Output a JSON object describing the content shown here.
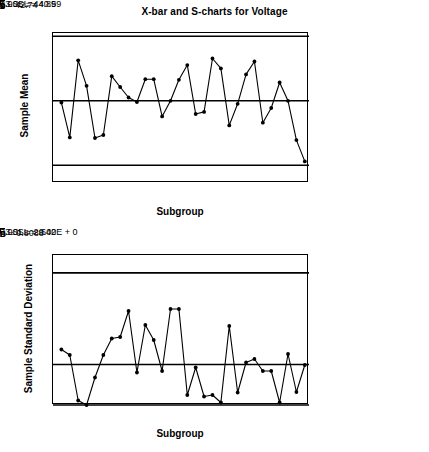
{
  "title": "X-bar and S-charts for Voltage",
  "charts": {
    "xbar": {
      "ylabel": "Sample Mean",
      "xlabel": "Subgroup",
      "yticks": [
        "40",
        "41",
        "42",
        "43",
        "44",
        "45"
      ],
      "xticks": [
        "0",
        "10",
        "20",
        "30"
      ],
      "ucl_label": "3.0SL = 44.89",
      "cl_bars": "=",
      "cl_symbol": "x",
      "cl_label": "= 42.74",
      "lcl_label": "−3.0SL = 40.59",
      "violation_marker": "1"
    },
    "s": {
      "ylabel": "Sample Standard Deviation",
      "xlabel": "Subgroup",
      "yticks": [
        "0",
        "1",
        "2",
        "3"
      ],
      "xticks": [
        "0",
        "10",
        "20",
        "30"
      ],
      "ucl_label": "3.0SL = 2.642",
      "cl_bars": "=",
      "cl_symbol": "S",
      "cl_label": "= 0.8088",
      "lcl_label": "−3.0SL = 0.00E + 0"
    }
  },
  "chart_data": [
    {
      "type": "line",
      "name": "xbar-chart",
      "title": "X-bar and S-charts for Voltage",
      "xlabel": "Subgroup",
      "ylabel": "Sample Mean",
      "xlim": [
        0,
        30.5
      ],
      "ylim": [
        40,
        45
      ],
      "yticks": [
        40,
        41,
        42,
        43,
        44,
        45
      ],
      "xticks": [
        0,
        10,
        20,
        30
      ],
      "grid": false,
      "center_line": 42.74,
      "upper_control_limit": 44.89,
      "lower_control_limit": 40.59,
      "x": [
        1,
        2,
        3,
        4,
        5,
        6,
        7,
        8,
        9,
        10,
        11,
        12,
        13,
        14,
        15,
        16,
        17,
        18,
        19,
        20,
        21,
        22,
        23,
        24,
        25,
        26,
        27,
        28,
        29,
        30
      ],
      "values": [
        42.68,
        41.52,
        44.09,
        43.24,
        41.5,
        41.6,
        43.56,
        43.2,
        42.85,
        42.7,
        43.46,
        43.46,
        42.22,
        42.74,
        43.44,
        43.93,
        42.3,
        42.37,
        44.15,
        43.82,
        41.92,
        42.64,
        43.62,
        44.05,
        42.01,
        42.5,
        43.35,
        42.74,
        41.43,
        40.72
      ],
      "annotations": [
        {
          "text": "1",
          "x": 30,
          "y": 40.72,
          "note": "out-of-control point below lower control limit"
        }
      ]
    },
    {
      "type": "line",
      "name": "s-chart",
      "xlabel": "Subgroup",
      "ylabel": "Sample Standard Deviation",
      "xlim": [
        0,
        30.5
      ],
      "ylim": [
        0,
        3
      ],
      "yticks": [
        0,
        1,
        2,
        3
      ],
      "xticks": [
        0,
        10,
        20,
        30
      ],
      "grid": false,
      "center_line": 0.8088,
      "upper_control_limit": 2.642,
      "lower_control_limit": 0.0,
      "x": [
        1,
        2,
        3,
        4,
        5,
        6,
        7,
        8,
        9,
        10,
        11,
        12,
        13,
        14,
        15,
        16,
        17,
        18,
        19,
        20,
        21,
        22,
        23,
        24,
        25,
        26,
        27,
        28,
        29,
        30
      ],
      "values": [
        1.11,
        1.0,
        0.09,
        0.0,
        0.55,
        1.0,
        1.33,
        1.36,
        1.88,
        0.65,
        1.6,
        1.3,
        0.68,
        1.92,
        1.92,
        0.2,
        0.75,
        0.17,
        0.2,
        0.05,
        1.58,
        0.25,
        0.85,
        0.92,
        0.68,
        0.68,
        0.05,
        1.02,
        0.26,
        0.8
      ]
    }
  ]
}
